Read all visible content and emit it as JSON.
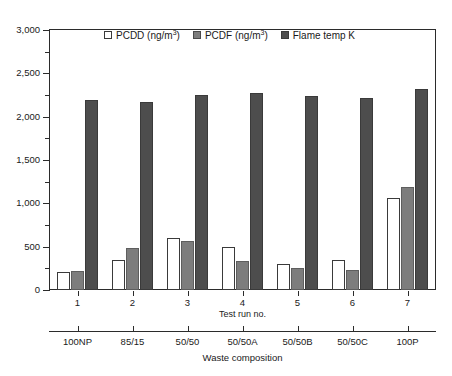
{
  "chart_data": {
    "type": "bar",
    "title": "",
    "xlabel": "Test run no.",
    "xlabel_secondary": "Waste composition",
    "ylabel": "",
    "ylim": [
      0,
      3000
    ],
    "ytick_values": [
      0,
      500,
      1000,
      1500,
      2000,
      2500,
      3000
    ],
    "ytick_labels": [
      "0",
      "500",
      "1,000",
      "1,500",
      "2,000",
      "2,500",
      "3,000"
    ],
    "yminor_values": [
      250,
      750,
      1250,
      1750,
      2250,
      2750
    ],
    "grid": false,
    "legend_position": "top-center",
    "categories": [
      "1",
      "2",
      "3",
      "4",
      "5",
      "6",
      "7"
    ],
    "categories_secondary": [
      "100NP",
      "85/15",
      "50/50",
      "50/50A",
      "50/50B",
      "50/50C",
      "100P"
    ],
    "series": [
      {
        "name": "PCDD (ng/m3)",
        "label_html": "PCDD (ng/m<sup>3</sup>)",
        "color": "#ffffff",
        "edge_color": "#3a3a3a",
        "values": [
          210,
          350,
          600,
          495,
          295,
          345,
          1060
        ]
      },
      {
        "name": "PCDF (ng/m3)",
        "label_html": "PCDF (ng/m<sup>3</sup>)",
        "color": "#7d7d7d",
        "edge_color": "#5e5e5e",
        "values": [
          225,
          480,
          570,
          330,
          255,
          235,
          1190
        ]
      },
      {
        "name": "Flame temp K",
        "label_html": "Flame temp K",
        "color": "#4d4d4d",
        "edge_color": "#3a3a3a",
        "values": [
          2195,
          2175,
          2245,
          2270,
          2240,
          2215,
          2320
        ]
      }
    ]
  },
  "legend": {
    "items": [
      {
        "key": "pcdd",
        "text": "PCDD (ng/m"
      },
      {
        "key": "pcdf",
        "text": "PCDF (ng/m"
      },
      {
        "key": "flame",
        "text": "Flame temp K"
      }
    ],
    "superscript": "3",
    "suffix": ")"
  },
  "axes": {
    "x_primary_title": "Test run no.",
    "x_secondary_title": "Waste composition"
  }
}
